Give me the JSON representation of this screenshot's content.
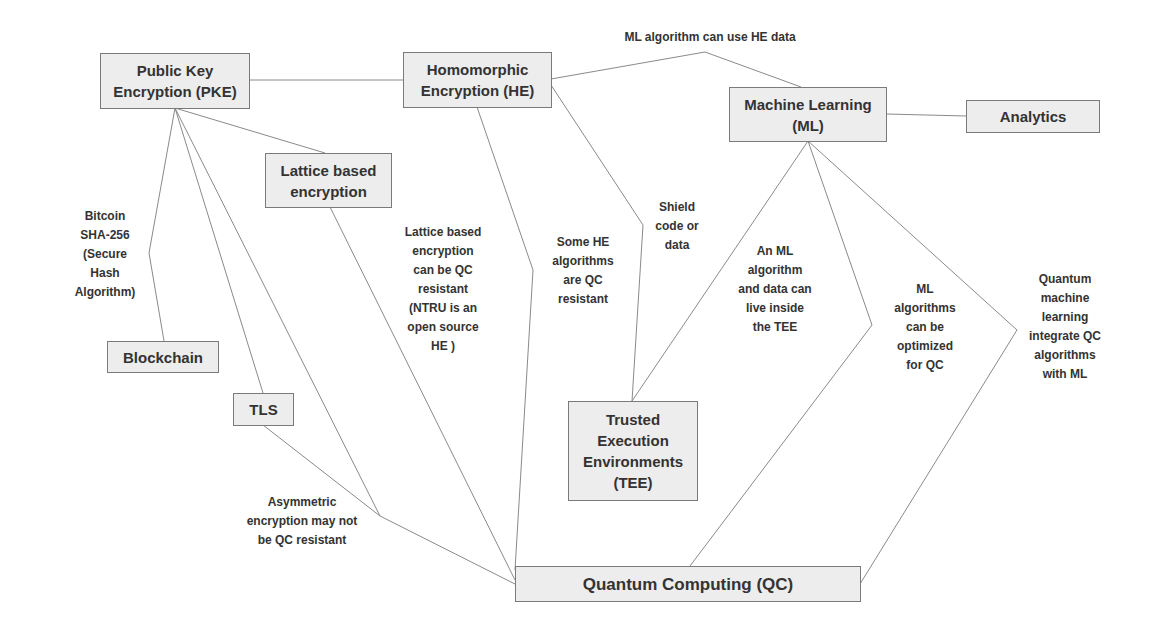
{
  "nodes": {
    "pke": "Public Key\nEncryption (PKE)",
    "he": "Homomorphic\nEncryption (HE)",
    "ml": "Machine Learning\n(ML)",
    "analytics": "Analytics",
    "lattice": "Lattice based\nencryption",
    "blockchain": "Blockchain",
    "tls": "TLS",
    "tee": "Trusted\nExecution\nEnvironments\n(TEE)",
    "qc": "Quantum Computing (QC)"
  },
  "edge_labels": {
    "he_ml": "ML algorithm can use HE data",
    "pke_blockchain": "Bitcoin\nSHA-256\n(Secure\nHash\nAlgorithm)",
    "lattice_qc": "Lattice based\nencryption\ncan be QC\nresistant\n(NTRU is an\nopen source\nHE )",
    "he_qc": "Some HE\nalgorithms\nare QC\nresistant",
    "he_tee": "Shield\ncode or\ndata",
    "ml_tee": "An ML\nalgorithm\nand data can\nlive inside\nthe TEE",
    "ml_qc": "ML\nalgorithms\ncan be\noptimized\nfor QC",
    "ml_qc_quantum": "Quantum\nmachine\nlearning\nintegrate QC\nalgorithms\nwith ML",
    "pke_tls_qc": "Asymmetric\nencryption may not\nbe QC resistant"
  },
  "colors": {
    "node_fill": "#ededed",
    "node_border": "#7a7a7a",
    "line": "#8a8a8a",
    "text": "#333333"
  }
}
